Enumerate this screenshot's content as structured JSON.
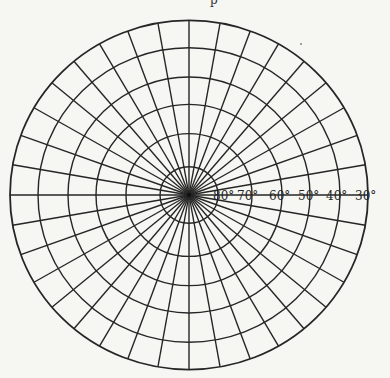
{
  "figure": {
    "title_fragment": "p",
    "type": "polar-grid-projection",
    "center": [
      189,
      195
    ],
    "spoke_interval_deg": 10,
    "colors": {
      "background": "#f6f6f3",
      "line": "#262626"
    },
    "circles": [
      {
        "label": "80°",
        "radius": 29,
        "label_x": 213
      },
      {
        "label": "70°",
        "radius": 63,
        "label_x": 237
      },
      {
        "label": "60°",
        "radius": 93,
        "label_x": 269
      },
      {
        "label": "50°",
        "radius": 121,
        "label_x": 298
      },
      {
        "label": "40°",
        "radius": 151,
        "label_x": 326
      },
      {
        "label": "30°",
        "radius": 179,
        "label_x": 355
      }
    ]
  }
}
